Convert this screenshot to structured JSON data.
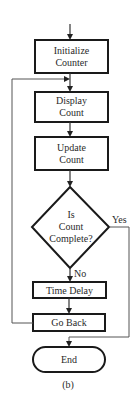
{
  "diagram": {
    "type": "flowchart",
    "caption": "(b)",
    "nodes": {
      "initialize": {
        "shape": "process",
        "lines": [
          "Initialize",
          "Counter"
        ]
      },
      "display": {
        "shape": "process",
        "lines": [
          "Display",
          "Count"
        ]
      },
      "update": {
        "shape": "process",
        "lines": [
          "Update",
          "Count"
        ]
      },
      "decision": {
        "shape": "decision",
        "lines": [
          "Is",
          "Count",
          "Complete?"
        ]
      },
      "delay": {
        "shape": "process",
        "lines": [
          "Time Delay"
        ]
      },
      "goback": {
        "shape": "process",
        "lines": [
          "Go Back"
        ]
      },
      "end": {
        "shape": "terminator",
        "lines": [
          "End"
        ]
      }
    },
    "edge_labels": {
      "yes": "Yes",
      "no": "No"
    },
    "edges": [
      {
        "from": "start",
        "to": "initialize"
      },
      {
        "from": "initialize",
        "to": "display"
      },
      {
        "from": "display",
        "to": "update"
      },
      {
        "from": "update",
        "to": "decision"
      },
      {
        "from": "decision",
        "to": "delay",
        "label": "No"
      },
      {
        "from": "decision",
        "to": "end",
        "label": "Yes"
      },
      {
        "from": "delay",
        "to": "goback"
      },
      {
        "from": "goback",
        "to": "display",
        "note": "loop back"
      }
    ]
  }
}
